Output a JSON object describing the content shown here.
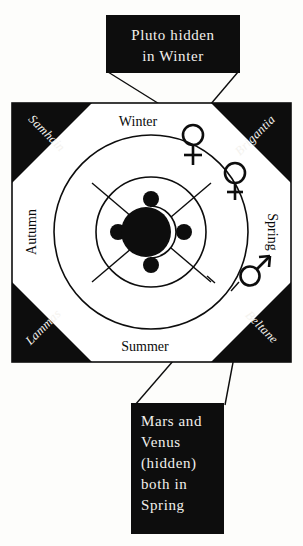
{
  "figure": {
    "background_color": "#fdfdfb",
    "ink_color": "#0d0d0d",
    "paper_color": "#ffffff",
    "callout_text_color": "#f2f0ec"
  },
  "callouts": {
    "top": {
      "name": "pluto-callout",
      "lines": [
        "Pluto  hidden",
        "in  Winter"
      ],
      "line1": "Pluto  hidden",
      "line2": "in  Winter",
      "background": "#0d0d0d",
      "text_color": "#f2f0ec",
      "points_to": "pluto-symbol"
    },
    "bottom": {
      "name": "mars-venus-callout",
      "lines": [
        "Mars  and",
        "Venus",
        "(hidden)",
        "both  in",
        "Spring"
      ],
      "line1": "Mars  and",
      "line2": "Venus",
      "line3": "(hidden)",
      "line4": "both  in",
      "line5": "Spring",
      "background": "#0d0d0d",
      "text_color": "#f2f0ec",
      "points_to": "mars-symbol"
    }
  },
  "wheel": {
    "seasons": [
      {
        "label": "Winter",
        "position": "top"
      },
      {
        "label": "Spring",
        "position": "right"
      },
      {
        "label": "Summer",
        "position": "bottom"
      },
      {
        "label": "Autumn",
        "position": "left"
      }
    ],
    "season_top": "Winter",
    "season_right": "Spring",
    "season_bottom": "Summer",
    "season_left": "Autumn",
    "festivals": [
      {
        "label": "Samhain",
        "position": "top-left"
      },
      {
        "label": "Brigantia",
        "position": "top-right"
      },
      {
        "label": "Beltane",
        "position": "bottom-right"
      },
      {
        "label": "Lammas",
        "position": "bottom-left"
      }
    ],
    "festival_top_left": "Samhain",
    "festival_top_right": "Brigantia",
    "festival_bottom_right": "Beltane",
    "festival_bottom_left": "Lammas",
    "corner_fill": "#0d0d0d"
  },
  "planets": [
    {
      "name": "Pluto",
      "symbol": "pluto-symbol",
      "glyph": "♀-with-crossbar",
      "placement": "Winter",
      "hidden": true
    },
    {
      "name": "Venus",
      "symbol": "venus-symbol",
      "glyph": "♀",
      "placement": "Spring",
      "hidden": true
    },
    {
      "name": "Mars",
      "symbol": "mars-symbol",
      "glyph": "♂",
      "placement": "Spring",
      "hidden": false
    }
  ],
  "moon_phases": {
    "outer_ring_count": 4,
    "outer_ring": [
      {
        "position": "top",
        "shape": "crescent",
        "opens": "left"
      },
      {
        "position": "right",
        "shape": "crescent",
        "opens": "left"
      },
      {
        "position": "bottom",
        "shape": "crescent",
        "opens": "left"
      },
      {
        "position": "left",
        "shape": "crescent",
        "opens": "right"
      }
    ],
    "inner_ring_count": 4,
    "inner_ring": [
      {
        "position": "top",
        "shape": "full-dot"
      },
      {
        "position": "right",
        "shape": "full-dot"
      },
      {
        "position": "bottom",
        "shape": "full-dot"
      },
      {
        "position": "left",
        "shape": "full-dot"
      }
    ],
    "center": {
      "shape": "dark-disc-with-crescent-notch"
    }
  }
}
